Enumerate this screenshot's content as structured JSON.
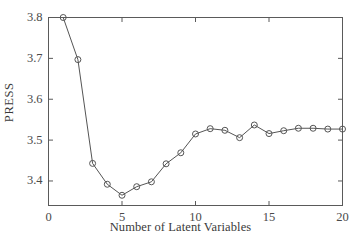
{
  "chart_data": {
    "type": "line",
    "title": "",
    "xlabel": "Number of Latent Variables",
    "ylabel": "PRESS",
    "x": [
      1,
      2,
      3,
      4,
      5,
      6,
      7,
      8,
      9,
      10,
      11,
      12,
      13,
      14,
      15,
      16,
      17,
      18,
      19,
      20
    ],
    "values": [
      3.8,
      3.697,
      3.443,
      3.392,
      3.365,
      3.386,
      3.398,
      3.442,
      3.469,
      3.515,
      3.528,
      3.524,
      3.506,
      3.537,
      3.516,
      3.523,
      3.529,
      3.529,
      3.527,
      3.527
    ],
    "series": [
      {
        "name": "PRESS",
        "values": [
          3.8,
          3.697,
          3.443,
          3.392,
          3.365,
          3.386,
          3.398,
          3.442,
          3.469,
          3.515,
          3.528,
          3.524,
          3.506,
          3.537,
          3.516,
          3.523,
          3.529,
          3.529,
          3.527,
          3.527
        ]
      }
    ],
    "xlim": [
      0,
      20
    ],
    "ylim": [
      3.34,
      3.8
    ],
    "xticks": [
      0,
      5,
      10,
      15,
      20
    ],
    "xtick_labels": [
      "0",
      "5",
      "10",
      "15",
      "20"
    ],
    "yticks": [
      3.4,
      3.5,
      3.6,
      3.7,
      3.8
    ],
    "ytick_labels": [
      "3.4",
      "3.5",
      "3.6",
      "3.7",
      "3.8"
    ],
    "grid": false,
    "legend": null,
    "legend_position": "none",
    "marker": "open-circle",
    "line_color": "#555555",
    "marker_color": "#555555",
    "axis_color": "#5a5a5a",
    "background_color": "#ffffff"
  },
  "axes": {
    "y_ticks": [
      {
        "label": "3.8",
        "value": 3.8
      },
      {
        "label": "3.7",
        "value": 3.7
      },
      {
        "label": "3.6",
        "value": 3.6
      },
      {
        "label": "3.5",
        "value": 3.5
      },
      {
        "label": "3.4",
        "value": 3.4
      }
    ],
    "x_ticks": [
      {
        "label": "0",
        "value": 0
      },
      {
        "label": "5",
        "value": 5
      },
      {
        "label": "10",
        "value": 10
      },
      {
        "label": "15",
        "value": 15
      },
      {
        "label": "20",
        "value": 20
      }
    ]
  }
}
